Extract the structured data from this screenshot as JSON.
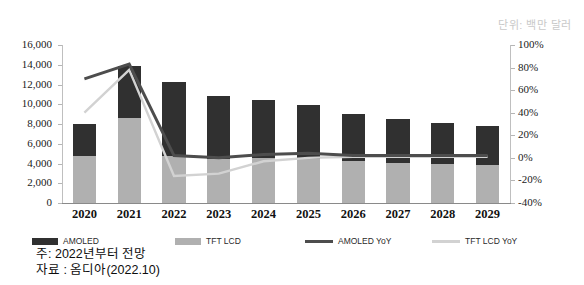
{
  "unit_note": "단위: 백만 달러",
  "footnotes": {
    "note": "주: 2022년부터 전망",
    "source": "자료 : 옴디아(2022.10)"
  },
  "colors": {
    "amoled": "#303030",
    "tft_lcd": "#b0b0b0",
    "amoled_yoy": "#4d4d4d",
    "tft_lcd_yoy": "#d2d2d2",
    "axis": "#bfbfbf"
  },
  "legend": [
    {
      "label": "AMOLED",
      "type": "bar",
      "color": "#303030"
    },
    {
      "label": "TFT LCD",
      "type": "bar",
      "color": "#b0b0b0"
    },
    {
      "label": "AMOLED YoY",
      "type": "line",
      "color": "#4d4d4d"
    },
    {
      "label": "TFT LCD YoY",
      "type": "line",
      "color": "#d2d2d2"
    }
  ],
  "chart_data": {
    "type": "bar",
    "title": "",
    "subtitle": "",
    "xlabel": "",
    "ylabel": "",
    "y2label": "",
    "grid": false,
    "legend_position": "bottom",
    "categories": [
      "2020",
      "2021",
      "2022",
      "2023",
      "2024",
      "2025",
      "2026",
      "2027",
      "2028",
      "2029"
    ],
    "ylim": [
      0,
      16000
    ],
    "yticks": [
      0,
      2000,
      4000,
      6000,
      8000,
      10000,
      12000,
      14000,
      16000
    ],
    "ytick_labels": [
      "0",
      "2,000",
      "4,000",
      "6,000",
      "8,000",
      "10,000",
      "12,000",
      "14,000",
      "16,000"
    ],
    "y2lim": [
      -40,
      100
    ],
    "y2ticks": [
      -40,
      -20,
      0,
      20,
      40,
      60,
      80,
      100
    ],
    "y2tick_labels": [
      "-40%",
      "-20%",
      "0%",
      "20%",
      "40%",
      "60%",
      "80%",
      "100%"
    ],
    "series": [
      {
        "name": "TFT LCD",
        "kind": "bar",
        "stack": "total",
        "axis": "left",
        "color": "#b0b0b0",
        "values": [
          4800,
          8600,
          4800,
          4500,
          4600,
          4500,
          4300,
          4100,
          4000,
          3900
        ]
      },
      {
        "name": "AMOLED",
        "kind": "bar",
        "stack": "total",
        "axis": "left",
        "color": "#303030",
        "values": [
          3200,
          5300,
          7500,
          6300,
          5800,
          5400,
          4700,
          4400,
          4100,
          3900
        ]
      },
      {
        "name": "AMOLED YoY",
        "kind": "line",
        "axis": "right",
        "color": "#4d4d4d",
        "values": [
          70,
          83,
          2,
          0,
          3,
          4,
          2,
          2,
          2,
          2
        ]
      },
      {
        "name": "TFT LCD YoY",
        "kind": "line",
        "axis": "right",
        "color": "#d2d2d2",
        "values": [
          40,
          78,
          -16,
          -14,
          -3,
          0,
          1,
          1,
          1,
          1
        ]
      }
    ],
    "totals": [
      8000,
      13900,
      12300,
      10800,
      10400,
      9900,
      9000,
      8500,
      8100,
      7800
    ]
  }
}
